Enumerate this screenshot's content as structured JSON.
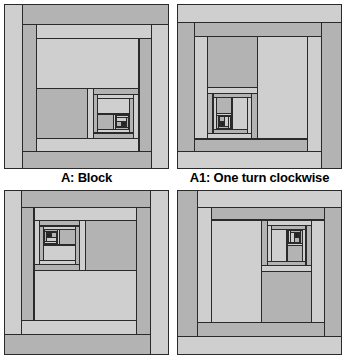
{
  "figure": {
    "background_color": "#ffffff",
    "width": 346,
    "height": 362
  },
  "palette": {
    "light": "#cfcfcf",
    "medium": "#b3b3b3",
    "dark_light": "#8a8a8a",
    "dark": "#1c1c1c",
    "black": "#111111",
    "outline": "#2a2a2a",
    "white": "#f2f2f2",
    "caption_color": "#000000"
  },
  "captions": {
    "block_a": "A: Block",
    "block_a1": "A1: One turn clockwise",
    "block_a2": "",
    "block_a3": ""
  },
  "blocks": [
    {
      "id": "A",
      "name": "block-a",
      "label": "A: Block",
      "rotation_degrees": 0,
      "core_corner": "bottom-right",
      "has_caption": true
    },
    {
      "id": "A1",
      "name": "block-a1",
      "label": "A1: One turn clockwise",
      "rotation_degrees": 90,
      "core_corner": "bottom-left",
      "has_caption": true
    },
    {
      "id": "A2",
      "name": "block-a2",
      "label": "",
      "rotation_degrees": 180,
      "core_corner": "top-left",
      "has_caption": false
    },
    {
      "id": "A3",
      "name": "block-a3",
      "label": "",
      "rotation_degrees": 270,
      "core_corner": "top-right",
      "has_caption": false
    }
  ],
  "pattern": {
    "description": "Recursive log cabin spiral: concentric L-shaped logs wrapping inward counterclockwise toward a dark core.",
    "size": 165,
    "levels": 4,
    "scale_per_level": 0.5,
    "logs_per_ring": 4,
    "ring_log_fractions": [
      0.11,
      0.12,
      0.115,
      0.12
    ],
    "shade_sequence": [
      "light",
      "medium",
      "light",
      "medium"
    ],
    "core_shades": [
      "dark",
      "black",
      "white",
      "medium"
    ],
    "stroke_width": 1.1
  }
}
